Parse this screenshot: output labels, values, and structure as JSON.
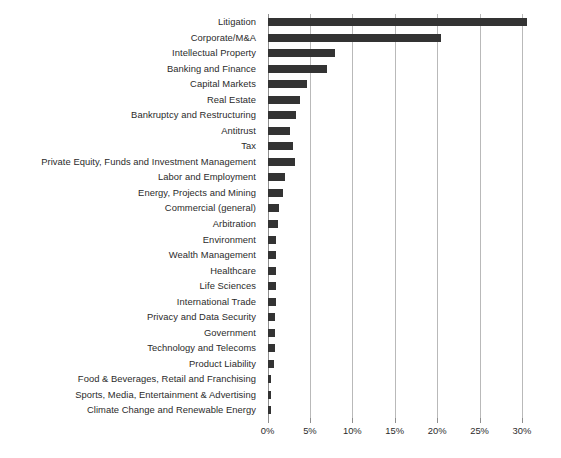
{
  "chart_data": {
    "type": "bar",
    "orientation": "horizontal",
    "title": "",
    "subtitle": "",
    "xlabel": "",
    "ylabel": "",
    "xlim": [
      0,
      30.5
    ],
    "grid": true,
    "legend": null,
    "legend_position": "none",
    "bar_color": "#333333",
    "grid_color": "#b9b9b9",
    "text_color": "#2b2b2b",
    "xticks": [
      0,
      5,
      10,
      15,
      20,
      25,
      30
    ],
    "xtick_labels": [
      "0%",
      "5%",
      "10%",
      "15%",
      "20%",
      "25%",
      "30%"
    ],
    "categories": [
      "Litigation",
      "Corporate/M&A",
      "Intellectual Property",
      "Banking and Finance",
      "Capital Markets",
      "Real Estate",
      "Bankruptcy and Restructuring",
      "Antitrust",
      "Tax",
      "Private Equity, Funds and Investment Management",
      "Labor and Employment",
      "Energy, Projects and Mining",
      "Commercial (general)",
      "Arbitration",
      "Environment",
      "Wealth Management",
      "Healthcare",
      "Life Sciences",
      "International Trade",
      "Privacy and Data Security",
      "Government",
      "Technology and Telecoms",
      "Product Liability",
      "Food & Beverages, Retail and Franchising",
      "Sports, Media, Entertainment & Advertising",
      "Climate Change and Renewable Energy"
    ],
    "values": [
      30.6,
      20.4,
      7.9,
      7.0,
      4.6,
      3.8,
      3.4,
      2.7,
      3.0,
      3.2,
      2.1,
      1.8,
      1.4,
      1.2,
      1.0,
      1.0,
      1.0,
      1.0,
      1.0,
      0.9,
      0.9,
      0.9,
      0.8,
      0.4,
      0.4,
      0.4
    ]
  }
}
